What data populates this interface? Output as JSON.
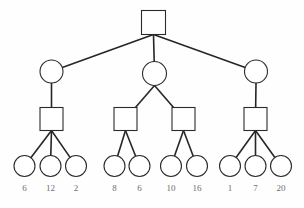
{
  "diagram": {
    "type": "tree",
    "background_color": "#fefefe",
    "node_fill_color": "#ffffff",
    "node_stroke_color": "#2b2b2b",
    "edge_color": "#262626",
    "label_color": "#6d6d6d",
    "levels": 4,
    "shapes": {
      "level1": "square",
      "level2": "circle",
      "level3": "square",
      "level4": "circle"
    },
    "nodes": {
      "root": [
        {
          "id": "r0",
          "shape": "square",
          "cx": 153.5,
          "cy": 22.5,
          "size": 24
        }
      ],
      "level2": [
        {
          "id": "a0",
          "shape": "circle",
          "cx": 51.5,
          "cy": 71.5,
          "r": 11.5
        },
        {
          "id": "a1",
          "shape": "circle",
          "cx": 154.5,
          "cy": 73.5,
          "r": 12.0
        },
        {
          "id": "a2",
          "shape": "circle",
          "cx": 256.0,
          "cy": 71.5,
          "r": 11.5
        }
      ],
      "level3": [
        {
          "id": "b0",
          "shape": "square",
          "cx": 51.5,
          "cy": 119.0,
          "size": 23
        },
        {
          "id": "b1",
          "shape": "square",
          "cx": 125.5,
          "cy": 119.0,
          "size": 23
        },
        {
          "id": "b2",
          "shape": "square",
          "cx": 183.5,
          "cy": 119.0,
          "size": 23
        },
        {
          "id": "b3",
          "shape": "square",
          "cx": 255.5,
          "cy": 119.0,
          "size": 23
        }
      ],
      "leaves": [
        {
          "id": "c0",
          "shape": "circle",
          "cx": 24.5,
          "cy": 166.0,
          "r": 10.5,
          "label": "6"
        },
        {
          "id": "c1",
          "shape": "circle",
          "cx": 50.5,
          "cy": 166.0,
          "r": 10.5,
          "label": "12"
        },
        {
          "id": "c2",
          "shape": "circle",
          "cx": 76.0,
          "cy": 166.0,
          "r": 10.5,
          "label": "2"
        },
        {
          "id": "c3",
          "shape": "circle",
          "cx": 114.5,
          "cy": 166.0,
          "r": 10.5,
          "label": "8"
        },
        {
          "id": "c4",
          "shape": "circle",
          "cx": 139.5,
          "cy": 166.0,
          "r": 10.5,
          "label": "6"
        },
        {
          "id": "c5",
          "shape": "circle",
          "cx": 171.0,
          "cy": 166.0,
          "r": 10.5,
          "label": "10"
        },
        {
          "id": "c6",
          "shape": "circle",
          "cx": 197.0,
          "cy": 166.0,
          "r": 10.5,
          "label": "16"
        },
        {
          "id": "c7",
          "shape": "circle",
          "cx": 230.0,
          "cy": 166.0,
          "r": 10.5,
          "label": "1"
        },
        {
          "id": "c8",
          "shape": "circle",
          "cx": 255.5,
          "cy": 166.0,
          "r": 10.5,
          "label": "7"
        },
        {
          "id": "c9",
          "shape": "circle",
          "cx": 281.0,
          "cy": 166.0,
          "r": 10.5,
          "label": "20"
        }
      ]
    },
    "edges": [
      {
        "from": "r0",
        "to": "a0"
      },
      {
        "from": "r0",
        "to": "a1"
      },
      {
        "from": "r0",
        "to": "a2"
      },
      {
        "from": "a0",
        "to": "b0"
      },
      {
        "from": "a1",
        "to": "b1"
      },
      {
        "from": "a1",
        "to": "b2"
      },
      {
        "from": "a2",
        "to": "b3"
      },
      {
        "from": "b0",
        "to": "c0"
      },
      {
        "from": "b0",
        "to": "c1"
      },
      {
        "from": "b0",
        "to": "c2"
      },
      {
        "from": "b1",
        "to": "c3"
      },
      {
        "from": "b1",
        "to": "c4"
      },
      {
        "from": "b2",
        "to": "c5"
      },
      {
        "from": "b2",
        "to": "c6"
      },
      {
        "from": "b3",
        "to": "c7"
      },
      {
        "from": "b3",
        "to": "c8"
      },
      {
        "from": "b3",
        "to": "c9"
      }
    ],
    "leaf_labels": {
      "values": [
        "6",
        "12",
        "2",
        "8",
        "6",
        "10",
        "16",
        "1",
        "7",
        "20"
      ],
      "y": 191,
      "font_size": 9
    }
  }
}
